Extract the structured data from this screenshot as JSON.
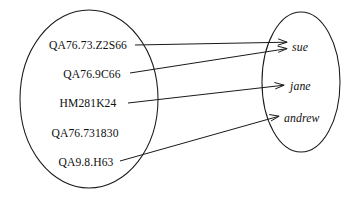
{
  "diagram": {
    "type": "mapping-diagram",
    "title": "",
    "stroke_color": "#1a1a1a",
    "background_color": "#ffffff",
    "domain_set": {
      "name": "call-numbers",
      "shape": "ellipse",
      "center_x": 89,
      "center_y": 99,
      "radius_x": 69,
      "radius_y": 89,
      "items": [
        {
          "label": "QA76.73.Z2S66",
          "x": 88,
          "y": 45
        },
        {
          "label": "QA76.9C66",
          "x": 92,
          "y": 74
        },
        {
          "label": "HM281K24",
          "x": 88,
          "y": 103
        },
        {
          "label": "QA76.731830",
          "x": 85,
          "y": 133
        },
        {
          "label": "QA9.8.H63",
          "x": 86,
          "y": 162
        }
      ]
    },
    "range_set": {
      "name": "borrowers",
      "shape": "ellipse",
      "center_x": 301,
      "center_y": 82,
      "radius_x": 39,
      "radius_y": 70,
      "items": [
        {
          "label": "sue",
          "x": 292,
          "y": 47
        },
        {
          "label": "jane",
          "x": 290,
          "y": 86
        },
        {
          "label": "andrew",
          "x": 284,
          "y": 118
        }
      ]
    },
    "arrows": [
      {
        "from": "QA76.73.Z2S66",
        "to": "sue",
        "x1": 135,
        "y1": 45,
        "x2": 287,
        "y2": 42
      },
      {
        "from": "QA76.9C66",
        "to": "sue",
        "x1": 130,
        "y1": 73,
        "x2": 287,
        "y2": 49
      },
      {
        "from": "HM281K24",
        "to": "jane",
        "x1": 128,
        "y1": 103,
        "x2": 284,
        "y2": 85
      },
      {
        "from": "QA9.8.H63",
        "to": "andrew",
        "x1": 120,
        "y1": 161,
        "x2": 279,
        "y2": 116
      }
    ]
  }
}
